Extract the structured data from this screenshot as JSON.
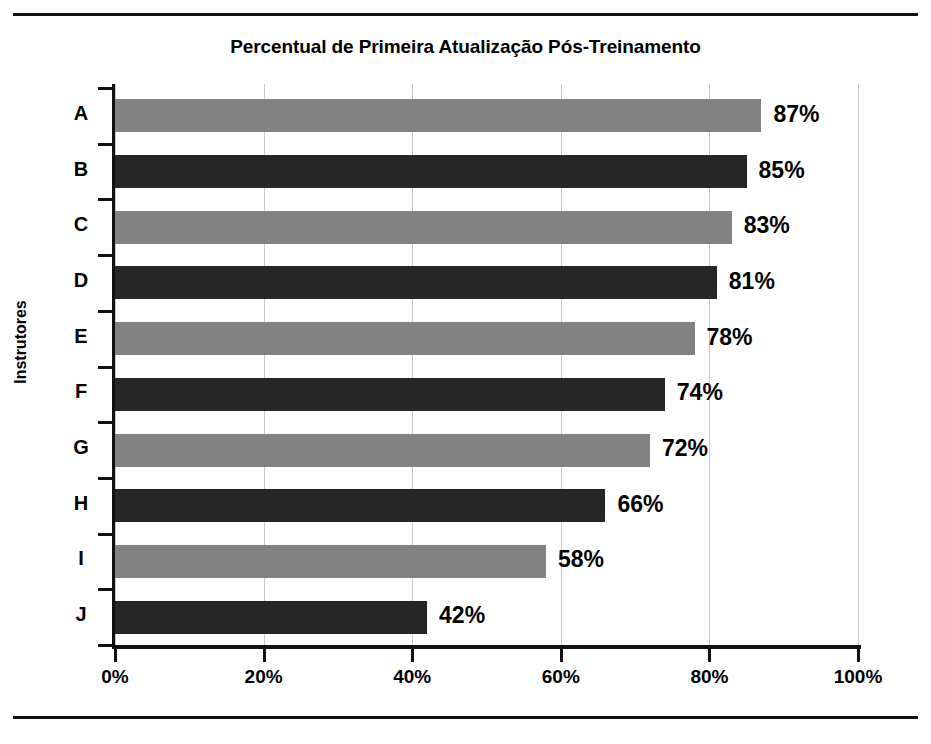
{
  "figure": {
    "title": "Percentual de Primeira Atualização Pós-Treinamento"
  },
  "chart_data": {
    "type": "bar",
    "orientation": "horizontal",
    "title": "Percentual de Primeira Atualização Pós-Treinamento",
    "xlabel": "",
    "ylabel": "Instrutores",
    "categories": [
      "A",
      "B",
      "C",
      "D",
      "E",
      "F",
      "G",
      "H",
      "I",
      "J"
    ],
    "values": [
      87,
      85,
      83,
      81,
      78,
      74,
      72,
      66,
      58,
      42
    ],
    "value_labels": [
      "87%",
      "85%",
      "83%",
      "81%",
      "78%",
      "74%",
      "72%",
      "66%",
      "58%",
      "42%"
    ],
    "bar_colors": [
      "#828282",
      "#262626",
      "#828282",
      "#262626",
      "#828282",
      "#262626",
      "#828282",
      "#262626",
      "#828282",
      "#262626"
    ],
    "xlim": [
      0,
      100
    ],
    "xticks": [
      0,
      20,
      40,
      60,
      80,
      100
    ],
    "xtick_labels": [
      "0%",
      "20%",
      "40%",
      "60%",
      "80%",
      "100%"
    ],
    "grid": "vertical",
    "legend": "none",
    "colors": {
      "gray_bar": "#828282",
      "dark_bar": "#262626",
      "gridline": "#c9c9c9",
      "axis": "#111111",
      "background": "#ffffff"
    }
  }
}
